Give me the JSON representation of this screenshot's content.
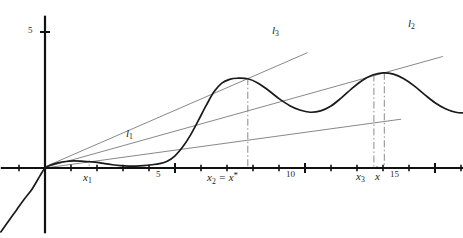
{
  "figure": {
    "kind": "math-function-plot",
    "background_color": "#ffffff",
    "curve_color": "#1a1a1a",
    "line_color": "#7a7a7a",
    "axis_color": "#111111",
    "dashdot_color": "#8a8a8a"
  },
  "axes": {
    "origin_px": {
      "x": 45,
      "y": 168
    },
    "x_unit_px": 26.0,
    "y_unit_px": 27.2,
    "x_axis": {
      "label": "",
      "tick_labels": [
        "5",
        "10",
        "15"
      ],
      "tick_values": [
        5,
        10,
        15
      ],
      "minor_tick_step": 1,
      "range": [
        -1.7,
        16.1
      ]
    },
    "y_axis": {
      "label": "",
      "tick_labels": [
        "5"
      ],
      "tick_values": [
        5
      ],
      "range": [
        -2.4,
        5.6
      ]
    }
  },
  "lines": [
    {
      "name": "l1",
      "label": "l1",
      "label_text": "l",
      "label_sub": "1",
      "slope": 0.131,
      "touch_x": 1.7,
      "touch_y": 0.22,
      "label_px": {
        "x": 126,
        "y": 130
      }
    },
    {
      "name": "l3",
      "label": "l3",
      "label_text": "l",
      "label_sub": "3",
      "slope": 0.42,
      "touch_x": 7.8,
      "touch_y": 3.28,
      "label_px": {
        "x": 272,
        "y": 27
      }
    },
    {
      "name": "l2",
      "label": "l2",
      "label_text": "l",
      "label_sub": "2",
      "slope": 0.268,
      "touch_x": 13.0,
      "touch_y": 3.48,
      "label_px": {
        "x": 408,
        "y": 20
      }
    }
  ],
  "markers": [
    {
      "name": "x1",
      "text": "x",
      "sub": "1",
      "sup": "",
      "x_value": 1.7,
      "label_px": {
        "x": 83,
        "y": 175
      },
      "vertical_line": "short-dash"
    },
    {
      "name": "x2",
      "text": "x",
      "sub": "2",
      "sup": "",
      "suffix": " = x",
      "sup2": "*",
      "x_value": 7.8,
      "full_label": "x2 = x*",
      "label_px": {
        "x": 205,
        "y": 173
      },
      "vertical_line": "dash-dot"
    },
    {
      "name": "x3",
      "text": "x",
      "sub": "3",
      "sup": "",
      "x_value": 12.65,
      "label_px": {
        "x": 355,
        "y": 173
      },
      "vertical_line": "dash-dot"
    },
    {
      "name": "xhat",
      "text": "x",
      "sub": "",
      "sup": "",
      "accent": "hat",
      "x_value": 13.05,
      "label_px": {
        "x": 377,
        "y": 173
      },
      "vertical_line": "dash-dot"
    }
  ],
  "chart_data": {
    "type": "line",
    "title": "",
    "xlabel": "",
    "ylabel": "",
    "xlim": [
      -1.7,
      16.1
    ],
    "ylim": [
      -2.4,
      5.6
    ],
    "grid": false,
    "legend": "inline-labels",
    "series": [
      {
        "name": "f(x)",
        "color": "#1a1a1a",
        "points_x": [
          -1.7,
          -1.4,
          -1.1,
          -0.8,
          -0.5,
          -0.2,
          0.0,
          0.25,
          0.5,
          0.8,
          1.1,
          1.4,
          1.7,
          2.0,
          2.3,
          2.6,
          2.9,
          3.2,
          3.5,
          3.8,
          4.1,
          4.4,
          4.7,
          5.0,
          5.3,
          5.6,
          5.9,
          6.2,
          6.5,
          6.8,
          7.1,
          7.4,
          7.8,
          8.2,
          8.6,
          9.0,
          9.4,
          9.8,
          10.2,
          10.6,
          11.0,
          11.4,
          11.8,
          12.2,
          12.6,
          13.0,
          13.4,
          13.8,
          14.2,
          14.6,
          15.0,
          15.4,
          15.8,
          16.1
        ],
        "points_y": [
          -2.35,
          -1.95,
          -1.55,
          -1.15,
          -0.78,
          -0.3,
          0.0,
          0.12,
          0.19,
          0.24,
          0.26,
          0.25,
          0.23,
          0.21,
          0.16,
          0.12,
          0.09,
          0.07,
          0.07,
          0.09,
          0.12,
          0.16,
          0.25,
          0.45,
          0.78,
          1.22,
          1.75,
          2.3,
          2.8,
          3.12,
          3.26,
          3.3,
          3.28,
          3.12,
          2.85,
          2.55,
          2.3,
          2.13,
          2.05,
          2.1,
          2.28,
          2.58,
          2.92,
          3.22,
          3.42,
          3.5,
          3.45,
          3.28,
          3.02,
          2.7,
          2.4,
          2.18,
          2.05,
          2.02
        ]
      }
    ],
    "annotations": [
      {
        "text": "l1",
        "x": 3.1,
        "y": 1.4
      },
      {
        "text": "l3",
        "x": 8.7,
        "y": 5.18
      },
      {
        "text": "l2",
        "x": 14.0,
        "y": 5.45
      },
      {
        "text": "x1",
        "x": 1.7,
        "y": -0.3
      },
      {
        "text": "x2 = x*",
        "x": 7.8,
        "y": -0.3
      },
      {
        "text": "x3",
        "x": 12.65,
        "y": -0.3
      },
      {
        "text": "xhat",
        "x": 13.05,
        "y": -0.3
      },
      {
        "text": "5",
        "x": 4.35,
        "y": -0.3
      },
      {
        "text": "10",
        "x": 9.35,
        "y": -0.3
      },
      {
        "text": "15",
        "x": 13.35,
        "y": -0.3
      },
      {
        "text": "5",
        "x": -0.55,
        "y": 4.95
      }
    ]
  }
}
